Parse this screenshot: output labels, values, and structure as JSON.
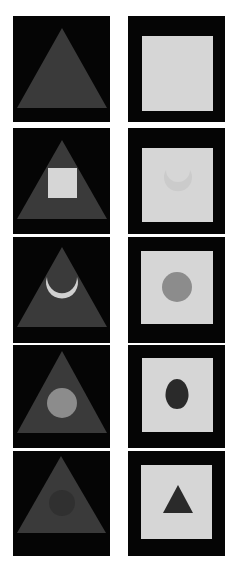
{
  "figure": {
    "colors": {
      "background": "#ffffff",
      "panel_dark": "#050505",
      "triangle": "#3a3a3a",
      "light_square": "#d6d6d6",
      "light_shape": "#d0d0d0",
      "mid_gray_circle": "#8c8c8c",
      "dark_shape": "#2a2a2a",
      "faint_ghost_light": "#cbcbcb",
      "faint_ghost_dark": "#303030"
    },
    "rows": [
      {
        "left": {
          "description": "Gray triangle on black",
          "inner": "none"
        },
        "right": {
          "description": "Light square on black",
          "inner": "none"
        }
      },
      {
        "left": {
          "description": "Gray triangle on black with light square",
          "inner": "square"
        },
        "right": {
          "description": "Light square on black with faint ghost shape",
          "inner": "faint-crescent"
        }
      },
      {
        "left": {
          "description": "Gray triangle on black with light crescent",
          "inner": "crescent"
        },
        "right": {
          "description": "Light square on black with gray circle",
          "inner": "circle"
        }
      },
      {
        "left": {
          "description": "Gray triangle on black with gray circle",
          "inner": "circle"
        },
        "right": {
          "description": "Light square on black with dark egg shape",
          "inner": "egg"
        }
      },
      {
        "left": {
          "description": "Gray triangle on black with faint dark circle",
          "inner": "faint-circle"
        },
        "right": {
          "description": "Light square on black with dark triangle",
          "inner": "triangle"
        }
      }
    ]
  }
}
